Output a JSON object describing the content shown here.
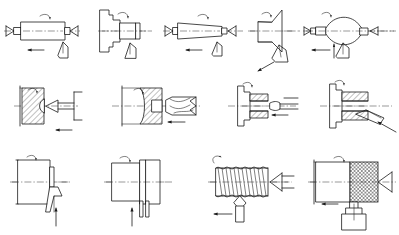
{
  "document": {
    "title": "Machining (Turning) Operations",
    "figure_type": "technical-line-diagram",
    "background_color": "#ffffff",
    "line_color": "#1a1a1a",
    "grid": {
      "columns": 4,
      "rows": 3,
      "cell_count": 12
    }
  },
  "legend": {
    "symbols": [
      {
        "name": "rotation-arrow",
        "meaning": "workpiece rotation (spindle speed)"
      },
      {
        "name": "feed-arrow",
        "meaning": "tool feed direction"
      },
      {
        "name": "centerline",
        "meaning": "axis of rotation"
      },
      {
        "name": "section-hatch",
        "meaning": "cut material in section view"
      },
      {
        "name": "lathe-center",
        "meaning": "workpiece supported between centers"
      }
    ]
  },
  "operations": [
    {
      "id": "op-1",
      "row": 1,
      "col": 1,
      "name": "straight-turning",
      "label": "Straight turning",
      "tool": "single-point turning tool",
      "workpiece": "cylindrical bar between centers",
      "feed": "axial-left",
      "rotation": "yes"
    },
    {
      "id": "op-2",
      "row": 1,
      "col": 2,
      "name": "shoulder-turning",
      "label": "Shoulder / step turning",
      "tool": "single-point turning tool",
      "workpiece": "stepped shaft in chuck",
      "feed": "axial",
      "rotation": "yes"
    },
    {
      "id": "op-3",
      "row": 1,
      "col": 3,
      "name": "taper-turning",
      "label": "Taper turning",
      "tool": "single-point turning tool",
      "workpiece": "tapered bar between centers",
      "feed": "angular-left",
      "rotation": "yes"
    },
    {
      "id": "op-4",
      "row": 1,
      "col": 4,
      "name": "chamfer-turning",
      "label": "Chamfering / angle turning",
      "tool": "single-point turning tool",
      "workpiece": "conical flange in chuck",
      "feed": "angular",
      "rotation": "yes"
    },
    {
      "id": "op-5",
      "row": 1,
      "col": 5,
      "name": "form-turning",
      "label": "Form (contour) turning",
      "tool": "form tool",
      "workpiece": "barrel profile between centers",
      "feed": "axial-left",
      "rotation": "yes"
    },
    {
      "id": "op-6",
      "row": 2,
      "col": 1,
      "name": "internal-boring",
      "label": "Boring (internal turning)",
      "tool": "boring bar",
      "workpiece": "sectioned bored part in chuck",
      "feed": "axial-left",
      "rotation": "yes"
    },
    {
      "id": "op-7",
      "row": 2,
      "col": 2,
      "name": "drilling",
      "label": "Drilling",
      "tool": "twist drill",
      "workpiece": "sectioned part in chuck",
      "feed": "axial-left",
      "rotation": "yes"
    },
    {
      "id": "op-8",
      "row": 2,
      "col": 3,
      "name": "internal-reaming",
      "label": "Reaming / internal finishing",
      "tool": "reamer",
      "workpiece": "sectioned bored flange",
      "feed": "axial-left",
      "rotation": "yes"
    },
    {
      "id": "op-9",
      "row": 2,
      "col": 4,
      "name": "internal-grooving",
      "label": "Internal grooving / recessing",
      "tool": "internal grooving tool",
      "workpiece": "sectioned flange",
      "feed": "radial",
      "rotation": "yes"
    },
    {
      "id": "op-10",
      "row": 3,
      "col": 1,
      "name": "facing",
      "label": "Facing",
      "tool": "facing tool",
      "workpiece": "disc in chuck",
      "feed": "radial-up",
      "rotation": "yes"
    },
    {
      "id": "op-11",
      "row": 3,
      "col": 2,
      "name": "parting-off",
      "label": "Parting off / cut-off",
      "tool": "parting blade",
      "workpiece": "bar in chuck",
      "feed": "radial-up",
      "rotation": "yes"
    },
    {
      "id": "op-12",
      "row": 3,
      "col": 3,
      "name": "thread-cutting",
      "label": "Thread cutting",
      "tool": "threading tool",
      "workpiece": "threaded shaft on center",
      "feed": "axial-left",
      "rotation": "yes"
    },
    {
      "id": "op-13",
      "row": 3,
      "col": 4,
      "name": "knurling",
      "label": "Knurling",
      "tool": "knurling tool",
      "workpiece": "shaft on center",
      "feed": "axial-left",
      "rotation": "yes"
    }
  ]
}
